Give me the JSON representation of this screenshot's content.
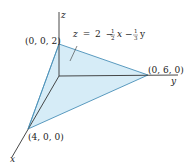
{
  "figure": {
    "type": "3d-plane-intercept-diagram",
    "plane_equation": "z = 2 − ½x − ⅓y",
    "equation_parts": {
      "lhs": "z",
      "eq": "=",
      "const": "2",
      "minus1": "−",
      "coef1_num": "1",
      "coef1_den": "2",
      "var1": "x",
      "minus2": "−",
      "coef2_num": "1",
      "coef2_den": "3",
      "var2": "y"
    },
    "axes": {
      "x_label": "x",
      "y_label": "y",
      "z_label": "z"
    },
    "vertices": [
      {
        "name": "z-intercept",
        "label": "(0, 0, 2)"
      },
      {
        "name": "y-intercept",
        "label": "(0, 6, 0)"
      },
      {
        "name": "x-intercept",
        "label": "(4, 0, 0)"
      }
    ],
    "colors": {
      "plane_fill": "#d6ecf7",
      "plane_edge": "#4a90b8",
      "axis": "#333333"
    }
  }
}
